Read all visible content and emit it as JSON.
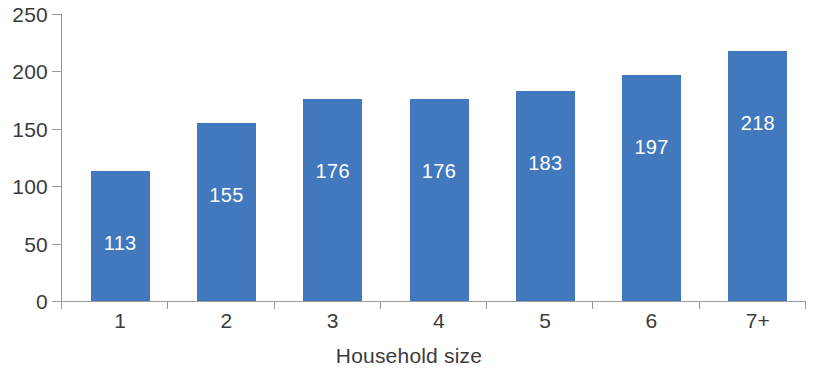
{
  "chart_data": {
    "type": "bar",
    "title": "",
    "subtitle": "",
    "xlabel": "Household size",
    "ylabel": "",
    "categories": [
      "1",
      "2",
      "3",
      "4",
      "5",
      "6",
      "7+"
    ],
    "values": [
      113,
      155,
      176,
      176,
      183,
      197,
      218
    ],
    "data_labels": [
      "113",
      "155",
      "176",
      "176",
      "183",
      "197",
      "218"
    ],
    "ylim": [
      0,
      250
    ],
    "ytick_labels": [
      "0",
      "50",
      "100",
      "150",
      "200",
      "250"
    ],
    "ytick_values": [
      0,
      50,
      100,
      150,
      200,
      250
    ],
    "grid": false,
    "legend": false,
    "legend_position": "none",
    "series": [
      {
        "name": "",
        "values": [
          113,
          155,
          176,
          176,
          183,
          197,
          218
        ]
      }
    ],
    "colors": {
      "bar": "#4178be",
      "data_label": "#ffffff",
      "axis": "#9a9a9a",
      "tick_text": "#3b3b3b",
      "background": "#ffffff"
    }
  }
}
